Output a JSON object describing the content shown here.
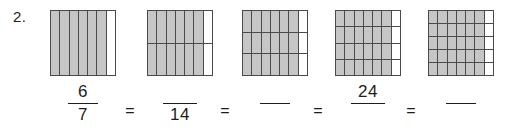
{
  "problem": {
    "number_label": "2.",
    "type": "equivalent-fractions-area-models"
  },
  "models": [
    {
      "name": "model-1",
      "left": 50,
      "columns": 7,
      "rows": 1,
      "shaded_columns": 6,
      "total_parts": 7,
      "shaded_parts": 6
    },
    {
      "name": "model-2",
      "left": 147,
      "columns": 7,
      "rows": 2,
      "shaded_columns": 6,
      "total_parts": 14,
      "shaded_parts": 12
    },
    {
      "name": "model-3",
      "left": 242,
      "columns": 7,
      "rows": 3,
      "shaded_columns": 6,
      "total_parts": 21,
      "shaded_parts": 18
    },
    {
      "name": "model-4",
      "left": 335,
      "columns": 7,
      "rows": 4,
      "shaded_columns": 6,
      "total_parts": 28,
      "shaded_parts": 24
    },
    {
      "name": "model-5",
      "left": 428,
      "columns": 7,
      "rows": 5,
      "shaded_columns": 6,
      "total_parts": 35,
      "shaded_parts": 30
    }
  ],
  "equation": {
    "fractions": [
      {
        "name": "fraction-1",
        "left": 56,
        "numerator": "6",
        "denominator": "7",
        "bar_width": "narrow"
      },
      {
        "name": "fraction-2",
        "left": 153,
        "numerator": "",
        "denominator": "14",
        "bar_width": "wide"
      },
      {
        "name": "fraction-3",
        "left": 248,
        "numerator": "",
        "denominator": "",
        "bar_width": "narrow"
      },
      {
        "name": "fraction-4",
        "left": 341,
        "numerator": "24",
        "denominator": "",
        "bar_width": "wide"
      },
      {
        "name": "fraction-5",
        "left": 434,
        "numerator": "",
        "denominator": "",
        "bar_width": "narrow"
      }
    ],
    "operators": [
      {
        "name": "equals-1",
        "left": 120,
        "symbol": "="
      },
      {
        "name": "equals-2",
        "left": 215,
        "symbol": "="
      },
      {
        "name": "equals-3",
        "left": 308,
        "symbol": "="
      },
      {
        "name": "equals-4",
        "left": 401,
        "symbol": "="
      }
    ]
  },
  "colors": {
    "shaded_fill": "#c6c6c6",
    "unshaded_fill": "#ffffff",
    "grid_line": "#4a4a4a",
    "text": "#1d1d1d",
    "background": "#ffffff"
  }
}
